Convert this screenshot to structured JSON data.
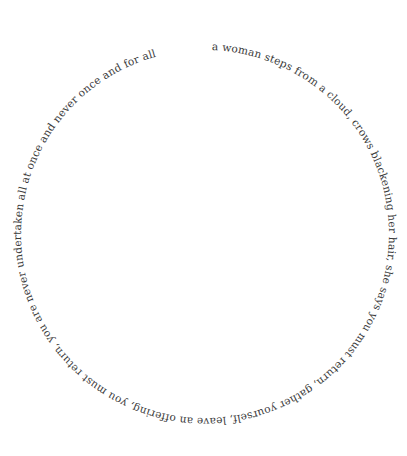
{
  "poem": {
    "text": "a woman steps from a cloud, crows blackening her hair, she says you must return, gather yourself, leave an offering, you must return, you are never undertaken all at once and never once and for all",
    "layout": "circular",
    "direction": "clockwise",
    "start_position": "top, just right of 12 o'clock",
    "color": "#3a3a3a",
    "background": "#ffffff"
  }
}
